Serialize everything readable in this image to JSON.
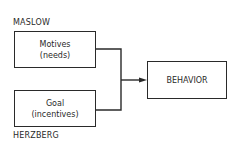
{
  "diagram": {
    "top_label": "MASLOW",
    "bottom_label": "HERZBERG",
    "nodes": {
      "motives": {
        "line1": "Motives",
        "line2": "(needs)"
      },
      "goal": {
        "line1": "Goal",
        "line2": "(incentives)"
      },
      "behavior": {
        "label": "BEHAVIOR"
      }
    },
    "edges": [
      {
        "from": "motives",
        "to": "behavior"
      },
      {
        "from": "goal",
        "to": "behavior"
      }
    ],
    "colors": {
      "stroke": "#2a2a2a",
      "background": "#ffffff"
    }
  }
}
